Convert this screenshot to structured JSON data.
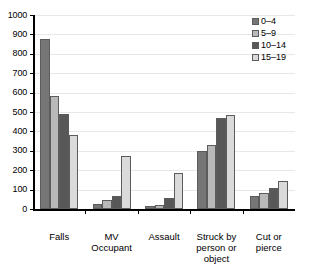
{
  "chart_data": {
    "type": "bar",
    "title": "",
    "xlabel": "",
    "ylabel": "",
    "ylim": [
      0,
      1000
    ],
    "ytick_step": 100,
    "yticks": [
      1000,
      900,
      800,
      700,
      600,
      500,
      400,
      300,
      200,
      100,
      0
    ],
    "grid": true,
    "legend_position": "top-right",
    "categories": [
      "Falls",
      "MV Occupant",
      "Assault",
      "Struck by person or object",
      "Cut or pierce"
    ],
    "series": [
      {
        "name": "0–4",
        "color": "#767676",
        "values": [
          875,
          25,
          15,
          300,
          65
        ]
      },
      {
        "name": "5–9",
        "color": "#b9b9b9",
        "values": [
          585,
          45,
          20,
          330,
          85
        ]
      },
      {
        "name": "10–14",
        "color": "#585858",
        "values": [
          490,
          65,
          55,
          470,
          110
        ]
      },
      {
        "name": "15–19",
        "color": "#dadada",
        "values": [
          380,
          275,
          185,
          485,
          145
        ]
      }
    ]
  },
  "legend": {
    "items": [
      {
        "label": "0–4"
      },
      {
        "label": "5–9"
      },
      {
        "label": "10–14"
      },
      {
        "label": "15–19"
      }
    ]
  },
  "axes": {
    "y_tick_labels": [
      "1000",
      "900",
      "800",
      "700",
      "600",
      "500",
      "400",
      "300",
      "200",
      "100",
      "0"
    ],
    "x_tick_labels": [
      "Falls",
      "MV Occupant",
      "Assault",
      "Struck by person or object",
      "Cut or pierce"
    ]
  },
  "colors": {
    "background": "#ffffff",
    "gridline": "#e8e8e8",
    "axis": "#000000",
    "bar_border": "#5c5c5c"
  }
}
